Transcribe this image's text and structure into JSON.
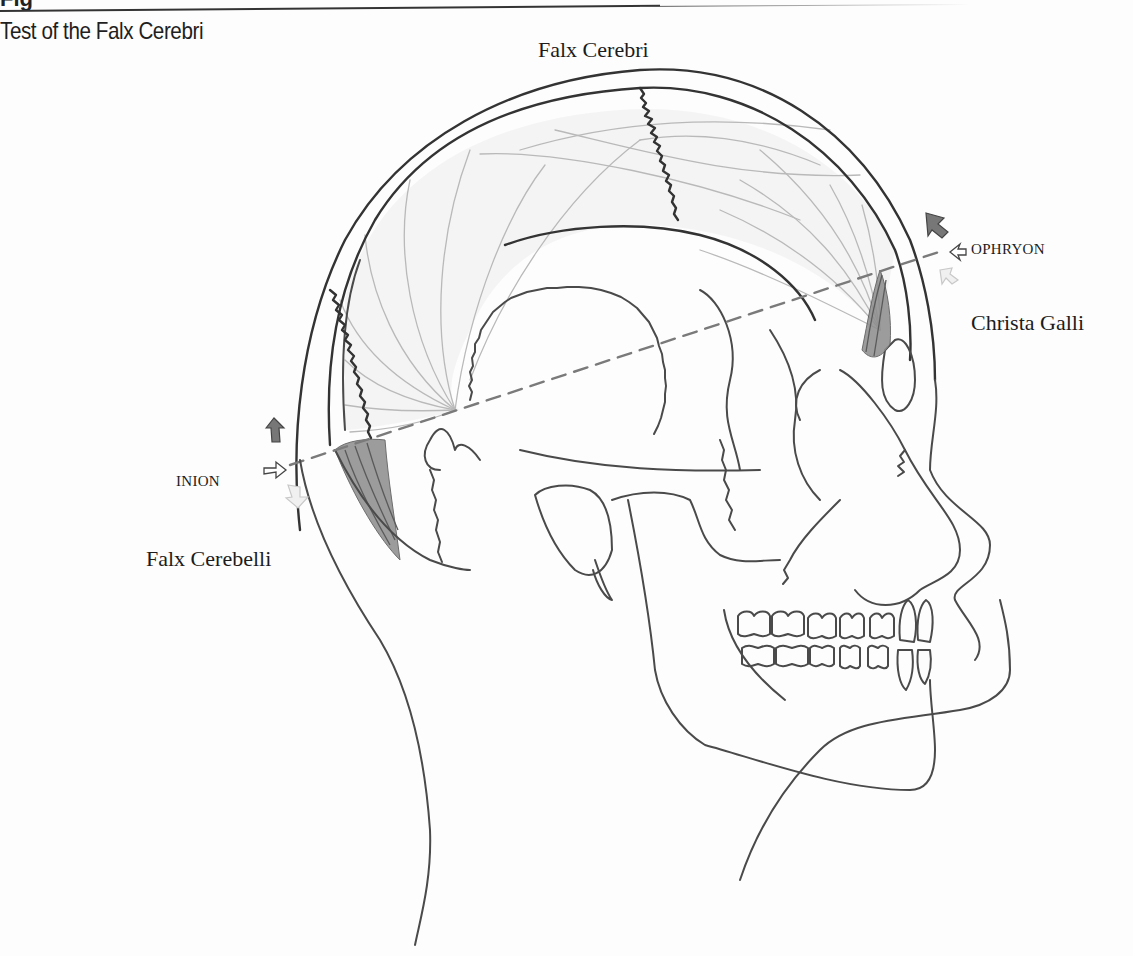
{
  "page": {
    "clipped_heading": "Fig",
    "caption": "Test of the Falx Cerebri"
  },
  "figure": {
    "type": "anatomical line drawing",
    "labels": {
      "falx_cerebri": {
        "text": "Falx Cerebri",
        "x": 525,
        "y": 57
      },
      "ophryon": {
        "text": "OPHRYON",
        "x": 970,
        "y": 254
      },
      "christa_galli": {
        "text": "Christa Galli",
        "x": 971,
        "y": 328
      },
      "inion": {
        "text": "INION",
        "x": 176,
        "y": 484
      },
      "falx_cerebelli": {
        "text": "Falx Cerebelli",
        "x": 146,
        "y": 565
      }
    },
    "arrows": {
      "ophryon": {
        "up": "dark-gray",
        "in": "outline",
        "down": "light-gray"
      },
      "inion": {
        "up": "dark-gray",
        "in": "outline",
        "down": "light-gray"
      }
    },
    "reference_line": {
      "from": "inion",
      "to": "ophryon",
      "style": "dashed"
    },
    "colors": {
      "ink": "#4a4a4a",
      "faint_fibers": "#b9b9b9",
      "dura_shading": "#8c8c8c",
      "dashed_line": "#7a7a7a",
      "background": "#fdfdfd"
    }
  }
}
